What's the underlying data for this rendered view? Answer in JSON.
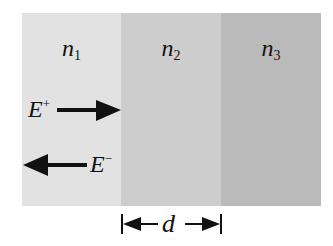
{
  "diagram": {
    "type": "thin-film layer structure",
    "layers": [
      {
        "label": "n",
        "subscript": "1",
        "color": "#e2e2e2"
      },
      {
        "label": "n",
        "subscript": "2",
        "color": "#cdcdcd"
      },
      {
        "label": "n",
        "subscript": "3",
        "color": "#bababa"
      }
    ],
    "waves": {
      "forward": {
        "label": "E",
        "superscript": "+",
        "direction": "right"
      },
      "backward": {
        "label": "E",
        "superscript": "−",
        "direction": "left"
      }
    },
    "thickness": {
      "label": "d",
      "spans_layer": "n2"
    }
  }
}
